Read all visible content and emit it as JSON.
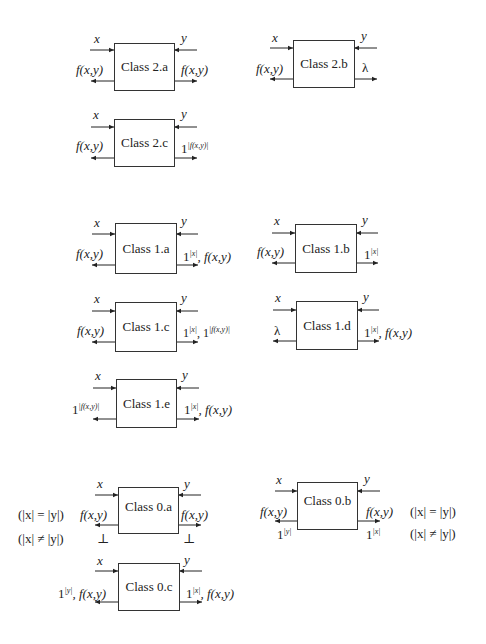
{
  "diagram": {
    "sections": [
      {
        "level": 2,
        "blocks": [
          {
            "id": "2a",
            "name": "Class 2.a",
            "in_left": "x",
            "in_right": "y",
            "out_left": "f(x,y)",
            "out_right": "f(x,y)"
          },
          {
            "id": "2b",
            "name": "Class 2.b",
            "in_left": "x",
            "in_right": "y",
            "out_left": "f(x,y)",
            "out_right": "λ"
          },
          {
            "id": "2c",
            "name": "Class 2.c",
            "in_left": "x",
            "in_right": "y",
            "out_left": "f(x,y)",
            "out_right_base": "1",
            "out_right_sup": "|f(x,y)|"
          }
        ]
      },
      {
        "level": 1,
        "blocks": [
          {
            "id": "1a",
            "name": "Class 1.a",
            "in_left": "x",
            "in_right": "y",
            "out_left": "f(x,y)",
            "out_right_base": "1",
            "out_right_sup": "|x|",
            "out_right_tail": ", f(x,y)"
          },
          {
            "id": "1b",
            "name": "Class 1.b",
            "in_left": "x",
            "in_right": "y",
            "out_left": "f(x,y)",
            "out_right_base": "1",
            "out_right_sup": "|x|"
          },
          {
            "id": "1c",
            "name": "Class 1.c",
            "in_left": "x",
            "in_right": "y",
            "out_left": "f(x,y)",
            "out_right_base": "1",
            "out_right_sup": "|x|",
            "out_right_tail": ", 1",
            "out_right_sup2": "|f(x,y)|"
          },
          {
            "id": "1d",
            "name": "Class 1.d",
            "in_left": "x",
            "in_right": "y",
            "out_left": "λ",
            "out_right_base": "1",
            "out_right_sup": "|x|",
            "out_right_tail": ", f(x,y)"
          },
          {
            "id": "1e",
            "name": "Class 1.e",
            "in_left": "x",
            "in_right": "y",
            "out_left_base": "1",
            "out_left_sup": "|f(x,y)|",
            "out_right_base": "1",
            "out_right_sup": "|x|",
            "out_right_tail": ", f(x,y)"
          }
        ]
      },
      {
        "level": 0,
        "blocks": [
          {
            "id": "0a",
            "name": "Class 0.a",
            "in_left": "x",
            "in_right": "y",
            "out_left": "f(x,y)",
            "out_right": "f(x,y)",
            "out_left_alt": "⊥",
            "out_right_alt": "⊥",
            "cond_eq": "(|x| = |y|)",
            "cond_neq": "(|x| ≠ |y|)"
          },
          {
            "id": "0b",
            "name": "Class 0.b",
            "in_left": "x",
            "in_right": "y",
            "out_left": "f(x,y)",
            "out_right": "f(x,y)",
            "out_left_alt_base": "1",
            "out_left_alt_sup": "|y|",
            "out_right_alt_base": "1",
            "out_right_alt_sup": "|x|",
            "cond_eq": "(|x| = |y|)",
            "cond_neq": "(|x| ≠ |y|)"
          },
          {
            "id": "0c",
            "name": "Class 0.c",
            "in_left": "x",
            "in_right": "y",
            "out_left_base": "1",
            "out_left_sup": "|y|",
            "out_left_tail": ", f(x,y)",
            "out_right_base": "1",
            "out_right_sup": "|x|",
            "out_right_tail": ", f(x,y)"
          }
        ]
      }
    ]
  }
}
